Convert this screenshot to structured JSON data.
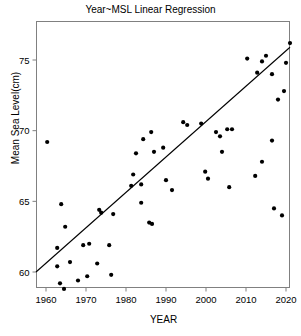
{
  "chart_data": {
    "type": "scatter",
    "title": "Year~MSL Linear Regression",
    "xlabel": "YEAR",
    "ylabel": "Mean Sea Level(cm)",
    "xlim": [
      1957.5,
      2021.0
    ],
    "ylim": [
      58.9,
      75.1
    ],
    "grid": false,
    "legend": null,
    "x_ticks": [
      1960,
      1970,
      1980,
      1990,
      2000,
      2010,
      2020
    ],
    "x_tick_labels": [
      "1960",
      "1970",
      "1980",
      "1990",
      "2000",
      "2010",
      "2020"
    ],
    "y_ticks": [
      60,
      65,
      70,
      75
    ],
    "y_tick_labels": [
      "60",
      "65",
      "70",
      "75"
    ],
    "marker_color": "#000000",
    "marker_size": 2.1,
    "line_color": "#000000",
    "series": [
      {
        "name": "Mean Sea Level observations",
        "type": "scatter",
        "points": [
          [
            1960.3,
            69.2
          ],
          [
            1963.8,
            64.8
          ],
          [
            1964.8,
            63.2
          ],
          [
            1962.8,
            61.7
          ],
          [
            1962.8,
            60.4
          ],
          [
            1966.0,
            60.7
          ],
          [
            1963.5,
            59.2
          ],
          [
            1964.5,
            58.8
          ],
          [
            1968.0,
            59.4
          ],
          [
            1969.3,
            61.9
          ],
          [
            1970.8,
            62.0
          ],
          [
            1973.3,
            64.4
          ],
          [
            1973.8,
            64.2
          ],
          [
            1976.8,
            64.1
          ],
          [
            1972.8,
            60.6
          ],
          [
            1975.8,
            61.9
          ],
          [
            1970.3,
            59.7
          ],
          [
            1976.3,
            59.8
          ],
          [
            1982.5,
            68.4
          ],
          [
            1981.8,
            66.9
          ],
          [
            1981.3,
            66.1
          ],
          [
            1983.8,
            66.2
          ],
          [
            1986.3,
            69.9
          ],
          [
            1984.3,
            69.4
          ],
          [
            1987.0,
            68.5
          ],
          [
            1989.3,
            68.8
          ],
          [
            1983.8,
            64.9
          ],
          [
            1985.8,
            63.5
          ],
          [
            1986.5,
            63.4
          ],
          [
            1990.0,
            66.5
          ],
          [
            1991.5,
            65.8
          ],
          [
            1994.3,
            70.6
          ],
          [
            1995.3,
            70.4
          ],
          [
            1998.8,
            70.5
          ],
          [
            1999.8,
            67.1
          ],
          [
            2002.5,
            69.9
          ],
          [
            2003.5,
            69.6
          ],
          [
            2005.3,
            70.1
          ],
          [
            2006.5,
            70.1
          ],
          [
            2004.0,
            68.5
          ],
          [
            2000.5,
            66.6
          ],
          [
            2005.8,
            66.0
          ],
          [
            2010.3,
            75.1
          ],
          [
            2014.0,
            74.9
          ],
          [
            2015.0,
            75.3
          ],
          [
            2012.8,
            74.1
          ],
          [
            2016.5,
            74.0
          ],
          [
            2018.0,
            72.2
          ],
          [
            2019.5,
            72.8
          ],
          [
            2020.0,
            74.8
          ],
          [
            2016.5,
            69.3
          ],
          [
            2014.0,
            67.8
          ],
          [
            2012.3,
            66.8
          ],
          [
            2017.0,
            64.5
          ],
          [
            2019.0,
            64.0
          ],
          [
            2021.0,
            76.2
          ]
        ]
      },
      {
        "name": "Linear regression fit",
        "type": "line",
        "points": [
          [
            1957.5,
            60.0
          ],
          [
            2021.0,
            75.9
          ]
        ]
      }
    ]
  },
  "axes": {
    "frame_color": "#808080"
  }
}
